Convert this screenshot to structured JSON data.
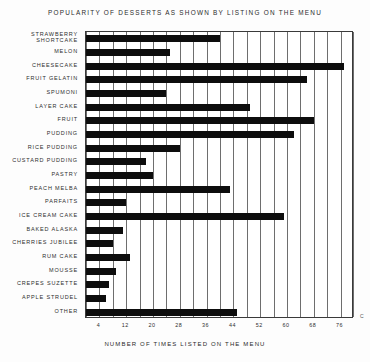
{
  "chart_data": {
    "type": "bar",
    "orientation": "horizontal",
    "title": "POPULARITY OF DESSERTS AS SHOWN BY LISTING ON THE MENU",
    "xlabel": "NUMBER OF TIMES LISTED ON THE MENU",
    "ylabel": "",
    "xlim": [
      0,
      80
    ],
    "ylim": null,
    "grid": true,
    "legend": null,
    "xticks": [
      4,
      12,
      20,
      28,
      36,
      44,
      52,
      60,
      68,
      76
    ],
    "xtick_labels": [
      "4",
      "12",
      "20",
      "28",
      "36",
      "44",
      "52",
      "60",
      "68",
      "76"
    ],
    "gridline_step": 4,
    "categories": [
      "STRAWBERRY SHORTCAKE",
      "MELON",
      "CHEESECAKE",
      "FRUIT GELATIN",
      "SPUMONI",
      "LAYER CAKE",
      "FRUIT",
      "PUDDING",
      "RICE PUDDING",
      "CUSTARD PUDDING",
      "PASTRY",
      "PEACH MELBA",
      "PARFAITS",
      "ICE CREAM CAKE",
      "BAKED ALASKA",
      "CHERRIES JUBILEE",
      "RUM CAKE",
      "MOUSSE",
      "CREPES SUZETTE",
      "APPLE STRUDEL",
      "OTHER"
    ],
    "values": [
      40,
      25,
      77,
      66,
      24,
      49,
      68,
      62,
      28,
      18,
      20,
      43,
      12,
      59,
      11,
      8,
      13,
      9,
      7,
      6,
      45
    ],
    "series": [
      {
        "name": "Number of times listed on the menu",
        "values": [
          40,
          25,
          77,
          66,
          24,
          49,
          68,
          62,
          28,
          18,
          20,
          43,
          12,
          59,
          11,
          8,
          13,
          9,
          7,
          6,
          45
        ]
      }
    ],
    "bar_color": "#0d0d0d",
    "axis_color": "#3a3a3a",
    "background": "#ffffff"
  },
  "annotations": {
    "corner_mark": "C"
  }
}
